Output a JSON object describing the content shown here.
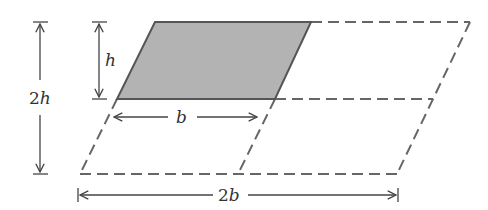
{
  "diagram": {
    "title": "",
    "labels": {
      "h": "h",
      "two_h_num": "2",
      "two_h_var": "h",
      "b": "b",
      "two_b_num": "2",
      "two_b_var": "b"
    },
    "colors": {
      "shaded_fill": "#b3b3b3",
      "stroke": "#555555",
      "dashed": "#666666",
      "text": "#333333"
    },
    "shapes": [
      {
        "name": "shaded-parallelogram",
        "base": "b",
        "height": "h",
        "style": "solid filled"
      },
      {
        "name": "large-parallelogram",
        "base": "2b",
        "height": "2h",
        "style": "dashed",
        "subdivided": "2x2 grid"
      }
    ],
    "dimensions": [
      {
        "name": "h",
        "orientation": "vertical"
      },
      {
        "name": "2h",
        "orientation": "vertical"
      },
      {
        "name": "b",
        "orientation": "horizontal"
      },
      {
        "name": "2b",
        "orientation": "horizontal"
      }
    ]
  }
}
